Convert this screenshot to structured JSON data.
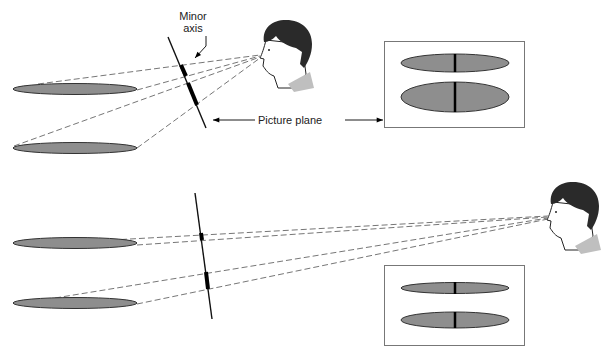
{
  "labels": {
    "minor_axis_line1": "Minor",
    "minor_axis_line2": "axis",
    "picture_plane": "Picture plane"
  },
  "colors": {
    "ellipse_fill": "#8e8e8e",
    "line": "#000000",
    "dashed": "#666666",
    "box_border": "#777777",
    "hair": "#2a2a2a"
  },
  "panels": [
    {
      "name": "top",
      "description": "Viewer close to picture plane; ellipses project with different minor axes"
    },
    {
      "name": "bottom",
      "description": "Viewer far from picture plane; ellipses project with similar minor axes"
    }
  ]
}
